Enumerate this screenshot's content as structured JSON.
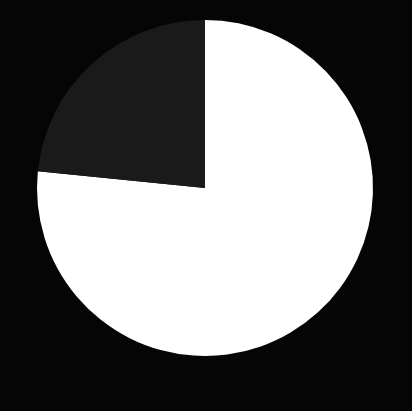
{
  "colors": {
    "background": "#050505",
    "slice_light": "#ffffff",
    "slice_dark": "#1a1a1a"
  },
  "chart_data": {
    "type": "pie",
    "title": "",
    "labels": [
      "Slice A",
      "Slice B"
    ],
    "values": [
      76.6,
      23.4
    ],
    "colors": [
      "#ffffff",
      "#1a1a1a"
    ],
    "start_angle_deg": 0,
    "direction": "clockwise",
    "center": [
      205,
      188
    ],
    "radius": 168,
    "legend": "none"
  }
}
